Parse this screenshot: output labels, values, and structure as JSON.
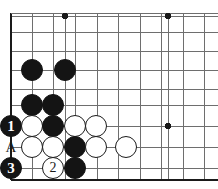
{
  "diagram": {
    "kind": "go-board-diagram",
    "board_geometry": {
      "edge_left_x": 11,
      "edge_top_y": 13,
      "edge_bottom_y": 180,
      "col_x": [
        11,
        32,
        53,
        75,
        97,
        118,
        140,
        161,
        183,
        204
      ],
      "row_y": [
        13,
        32,
        51,
        70,
        89,
        108,
        126,
        147,
        168
      ],
      "line_color": "#6e6e6e",
      "edge_color": "#1a1a1a",
      "background_color": "#ffffff",
      "stone_radius": 11
    },
    "star_points": [
      {
        "x": 65,
        "y": 16
      },
      {
        "x": 168,
        "y": 16
      },
      {
        "x": 168,
        "y": 126
      }
    ],
    "stones": [
      {
        "id": "b-c2-r4",
        "color": "black",
        "x": 32,
        "y": 70,
        "label": ""
      },
      {
        "id": "b-c4-r4",
        "color": "black",
        "x": 65,
        "y": 70,
        "label": ""
      },
      {
        "id": "b-c2-r6",
        "color": "black",
        "x": 32,
        "y": 105,
        "label": ""
      },
      {
        "id": "b-c3-r6",
        "color": "black",
        "x": 53,
        "y": 105,
        "label": ""
      },
      {
        "id": "b-c1-r7",
        "color": "black",
        "x": 11,
        "y": 126,
        "label": "1"
      },
      {
        "id": "w-c2-r7",
        "color": "white",
        "x": 32,
        "y": 126,
        "label": ""
      },
      {
        "id": "b-c3-r7",
        "color": "black",
        "x": 53,
        "y": 126,
        "label": ""
      },
      {
        "id": "w-c4-r7",
        "color": "white",
        "x": 75,
        "y": 126,
        "label": ""
      },
      {
        "id": "w-c5-r7",
        "color": "white",
        "x": 96,
        "y": 126,
        "label": ""
      },
      {
        "id": "w-c2-r8",
        "color": "white",
        "x": 32,
        "y": 147,
        "label": ""
      },
      {
        "id": "w-c3-r8",
        "color": "white",
        "x": 53,
        "y": 147,
        "label": ""
      },
      {
        "id": "b-c4-r8",
        "color": "black",
        "x": 75,
        "y": 147,
        "label": ""
      },
      {
        "id": "w-c5-r8",
        "color": "white",
        "x": 96,
        "y": 147,
        "label": ""
      },
      {
        "id": "w-c7-r8",
        "color": "white",
        "x": 126,
        "y": 147,
        "label": ""
      },
      {
        "id": "b-c1-r9",
        "color": "black",
        "x": 11,
        "y": 168,
        "label": "3"
      },
      {
        "id": "w-c3-r9",
        "color": "white",
        "x": 53,
        "y": 168,
        "label": "2"
      },
      {
        "id": "b-c4-r9",
        "color": "black",
        "x": 75,
        "y": 168,
        "label": ""
      }
    ],
    "point_labels": [
      {
        "id": "label-a",
        "text": "A",
        "x": 11,
        "y": 147
      }
    ],
    "move_numbers": {
      "black_1": "1",
      "white_2": "2",
      "black_3": "3"
    }
  }
}
